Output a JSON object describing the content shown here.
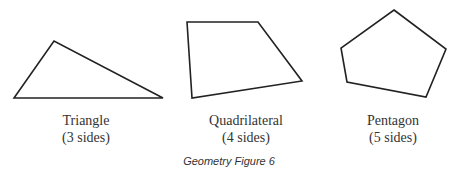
{
  "figure": {
    "caption": "Geometry Figure 6",
    "stroke_color": "#222222",
    "shapes": [
      {
        "name": "Triangle",
        "sides_label": "(3 sides)",
        "points": "14,98 54,41 163,98"
      },
      {
        "name": "Quadrilateral",
        "sides_label": "(4 sides)",
        "points": "187,22 258,22 302,81 192,98"
      },
      {
        "name": "Pentagon",
        "sides_label": "(5 sides)",
        "points": "394,10 446,49 426,97 347,82 341,48"
      }
    ]
  }
}
